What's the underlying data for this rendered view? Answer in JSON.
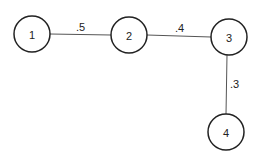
{
  "diagram": {
    "type": "weighted-graph",
    "nodes": [
      {
        "id": "1",
        "label": "1",
        "cx": 32,
        "cy": 34,
        "r": 18
      },
      {
        "id": "2",
        "label": "2",
        "cx": 129,
        "cy": 35,
        "r": 18
      },
      {
        "id": "3",
        "label": "3",
        "cx": 229,
        "cy": 37,
        "r": 18
      },
      {
        "id": "4",
        "label": "4",
        "cx": 226,
        "cy": 132,
        "r": 18
      }
    ],
    "edges": [
      {
        "from": "1",
        "to": "2",
        "weight": ".5"
      },
      {
        "from": "2",
        "to": "3",
        "weight": ".4"
      },
      {
        "from": "3",
        "to": "4",
        "weight": ".3"
      }
    ]
  }
}
